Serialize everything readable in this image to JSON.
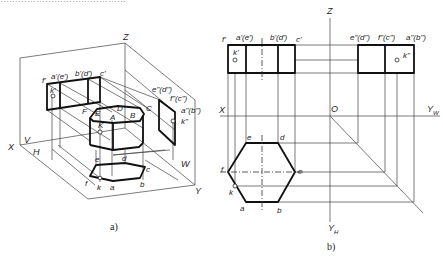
{
  "header": {
    "cut_off_text": "……………………………………"
  },
  "figure_a": {
    "caption": "a)",
    "axis_labels": {
      "x": "X",
      "y": "Y",
      "z": "Z"
    },
    "plane_labels": {
      "v": "V",
      "h": "H",
      "w": "W"
    },
    "solid_labels": {
      "A": "A",
      "B": "B",
      "C": "C",
      "D": "D",
      "E": "E",
      "F": "F",
      "K": "K"
    },
    "front_projection_labels": {
      "f": "f'",
      "ae": "a'(e')",
      "bd": "b'(d')",
      "c": "c'",
      "k": "k'"
    },
    "side_projection_labels": {
      "ed": "e\"(d\")",
      "fc": "f\"(c\")",
      "ab": "a\"(b\")",
      "k": "k\""
    },
    "top_projection_labels": {
      "a": "a",
      "b": "b",
      "c": "c",
      "d": "d",
      "e": "e",
      "f": "f",
      "k": "k"
    }
  },
  "figure_b": {
    "caption": "b)",
    "axis_labels": {
      "x": "X",
      "z": "Z",
      "o": "O",
      "yw": "Y",
      "yw_sub": "W",
      "yh": "Y",
      "yh_sub": "H"
    },
    "front_view_labels": {
      "f": "f'",
      "ae": "a'(e')",
      "bd": "b'(d')",
      "c": "c'",
      "k": "k'"
    },
    "side_view_labels": {
      "ed": "e\"(d\")",
      "fc": "f\"(c\")",
      "ab": "a\"(b\")",
      "k": "k\""
    },
    "top_view_labels": {
      "a": "a",
      "b": "b",
      "c": "c",
      "d": "d",
      "e": "e",
      "f": "f",
      "k": "k"
    }
  }
}
